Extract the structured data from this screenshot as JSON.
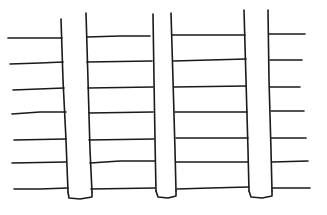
{
  "diagram": {
    "stroke_color": "#1a1a1a",
    "background": "#ffffff",
    "posts": [
      {
        "name": "post-1",
        "left_edge": [
          [
            61,
            19
          ],
          [
            63,
            80
          ],
          [
            66,
            140
          ],
          [
            68,
            192
          ]
        ],
        "right_edge": [
          [
            86,
            13
          ],
          [
            88,
            80
          ],
          [
            90,
            150
          ],
          [
            92,
            192
          ]
        ],
        "bottom": [
          [
            68,
            192
          ],
          [
            69,
            198
          ],
          [
            80,
            199
          ],
          [
            92,
            197
          ],
          [
            92,
            192
          ]
        ]
      },
      {
        "name": "post-2",
        "left_edge": [
          [
            153,
            14
          ],
          [
            154,
            80
          ],
          [
            155,
            140
          ],
          [
            156,
            191
          ]
        ],
        "right_edge": [
          [
            171,
            13
          ],
          [
            173,
            80
          ],
          [
            175,
            150
          ],
          [
            176,
            191
          ]
        ],
        "bottom": [
          [
            156,
            191
          ],
          [
            158,
            197
          ],
          [
            168,
            198
          ],
          [
            176,
            196
          ],
          [
            176,
            191
          ]
        ]
      },
      {
        "name": "post-3",
        "left_edge": [
          [
            244,
            10
          ],
          [
            246,
            80
          ],
          [
            248,
            150
          ],
          [
            249,
            191
          ]
        ],
        "right_edge": [
          [
            268,
            10
          ],
          [
            269,
            80
          ],
          [
            271,
            150
          ],
          [
            272,
            191
          ]
        ],
        "bottom": [
          [
            249,
            191
          ],
          [
            251,
            197
          ],
          [
            262,
            198
          ],
          [
            272,
            196
          ],
          [
            272,
            191
          ]
        ]
      }
    ],
    "rail_sections": [
      {
        "name": "rails-left",
        "rails": [
          [
            [
              8,
              38
            ],
            [
              62,
              38
            ]
          ],
          [
            [
              10,
              64
            ],
            [
              40,
              63
            ],
            [
              63,
              62
            ]
          ],
          [
            [
              13,
              90
            ],
            [
              64,
              88
            ]
          ],
          [
            [
              12,
              114
            ],
            [
              40,
              112
            ],
            [
              66,
              112
            ]
          ],
          [
            [
              14,
              140
            ],
            [
              66,
              139
            ]
          ],
          [
            [
              12,
              163
            ],
            [
              66,
              162
            ]
          ],
          [
            [
              14,
              189
            ],
            [
              40,
              189
            ],
            [
              68,
              188
            ]
          ]
        ]
      },
      {
        "name": "rails-middle-left",
        "rails": [
          [
            [
              87,
              37
            ],
            [
              120,
              36
            ],
            [
              150,
              36
            ]
          ],
          [
            [
              87,
              62
            ],
            [
              152,
              61
            ]
          ],
          [
            [
              88,
              88
            ],
            [
              153,
              87
            ]
          ],
          [
            [
              89,
              113
            ],
            [
              153,
              112
            ]
          ],
          [
            [
              89,
              140
            ],
            [
              154,
              139
            ]
          ],
          [
            [
              90,
              163
            ],
            [
              120,
              161
            ],
            [
              155,
              161
            ]
          ],
          [
            [
              91,
              189
            ],
            [
              155,
              188
            ]
          ]
        ]
      },
      {
        "name": "rails-middle-right",
        "rails": [
          [
            [
              172,
              35
            ],
            [
              245,
              35
            ]
          ],
          [
            [
              173,
              61
            ],
            [
              210,
              60
            ],
            [
              246,
              59
            ]
          ],
          [
            [
              174,
              87
            ],
            [
              246,
              86
            ]
          ],
          [
            [
              175,
              112
            ],
            [
              247,
              112
            ]
          ],
          [
            [
              176,
              138
            ],
            [
              248,
              138
            ]
          ],
          [
            [
              176,
              162
            ],
            [
              248,
              162
            ]
          ],
          [
            [
              177,
              189
            ],
            [
              210,
              188
            ],
            [
              249,
              187
            ]
          ]
        ]
      },
      {
        "name": "rails-right",
        "rails": [
          [
            [
              269,
              34
            ],
            [
              305,
              34
            ]
          ],
          [
            [
              270,
              60
            ],
            [
              302,
              60
            ]
          ],
          [
            [
              270,
              87
            ],
            [
              300,
              87
            ]
          ],
          [
            [
              271,
              111
            ],
            [
              304,
              111
            ]
          ],
          [
            [
              271,
              138
            ],
            [
              306,
              138
            ]
          ],
          [
            [
              272,
              162
            ],
            [
              308,
              161
            ]
          ],
          [
            [
              272,
              188
            ],
            [
              310,
              188
            ]
          ]
        ]
      }
    ]
  }
}
